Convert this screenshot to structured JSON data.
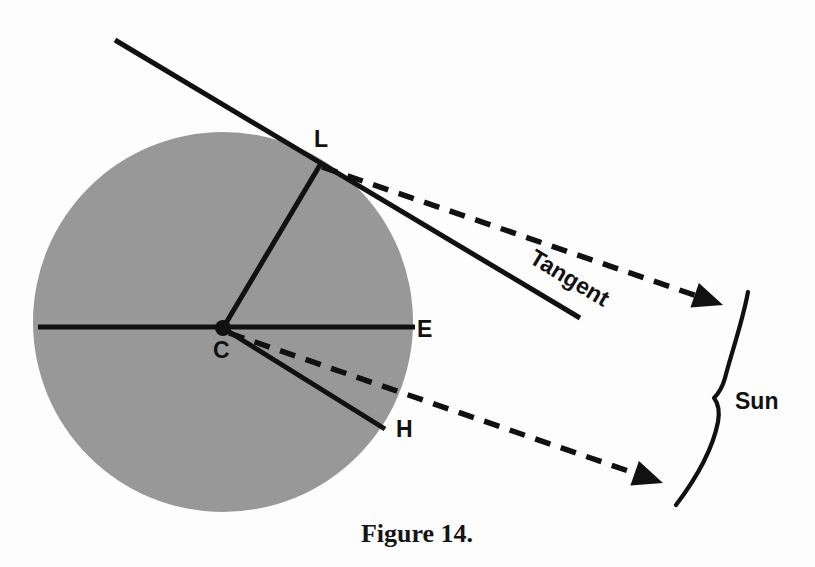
{
  "figure": {
    "caption": "Figure 14.",
    "background_color": "#fdfdfd",
    "ink_color": "#111111",
    "disc_color": "#989898"
  },
  "labels": {
    "point_l": "L",
    "point_c": "C",
    "point_e": "E",
    "point_h": "H",
    "tangent": "Tangent",
    "sun": "Sun"
  },
  "chart_data": {
    "type": "diagram",
    "title": "Figure 14.",
    "points": [
      {
        "name": "C",
        "role": "circle-center",
        "x": 223,
        "y": 328
      },
      {
        "name": "L",
        "role": "tangent-point-on-circle",
        "x": 320,
        "y": 165
      },
      {
        "name": "E",
        "role": "limb-end-of-horizontal-radius",
        "x": 415,
        "y": 327
      },
      {
        "name": "H",
        "role": "end-of-lower-radius",
        "x": 385,
        "y": 429
      }
    ],
    "circle": {
      "cx": 223,
      "cy": 322,
      "r": 190,
      "fill": "#989898"
    },
    "solid_segments": [
      {
        "name": "horizontal-diameter-CE",
        "from": [
          38,
          327
        ],
        "to": [
          415,
          327
        ],
        "width": 5
      },
      {
        "name": "radius-CL",
        "from": [
          223,
          328
        ],
        "to": [
          320,
          165
        ],
        "width": 5
      },
      {
        "name": "radius-CH",
        "from": [
          223,
          328
        ],
        "to": [
          385,
          429
        ],
        "width": 5
      },
      {
        "name": "tangent-line",
        "from": [
          115,
          40
        ],
        "to": [
          580,
          318
        ],
        "width": 5
      }
    ],
    "dashed_arrows": [
      {
        "name": "sight-line-from-L-to-sun",
        "from": [
          322,
          167
        ],
        "to": [
          723,
          305
        ]
      },
      {
        "name": "sight-line-from-C-to-sun",
        "from": [
          229,
          333
        ],
        "to": [
          663,
          483
        ]
      }
    ],
    "sun_arc": {
      "name": "sun-limb-curve",
      "top": [
        748,
        292
      ],
      "waist": [
        714,
        398
      ],
      "bottom": [
        676,
        505
      ]
    },
    "annotations": [
      {
        "text": "Tangent",
        "x": 576,
        "y": 278,
        "rotation_deg": 31
      },
      {
        "text": "Sun",
        "x": 735,
        "y": 400,
        "rotation_deg": 0
      }
    ]
  }
}
